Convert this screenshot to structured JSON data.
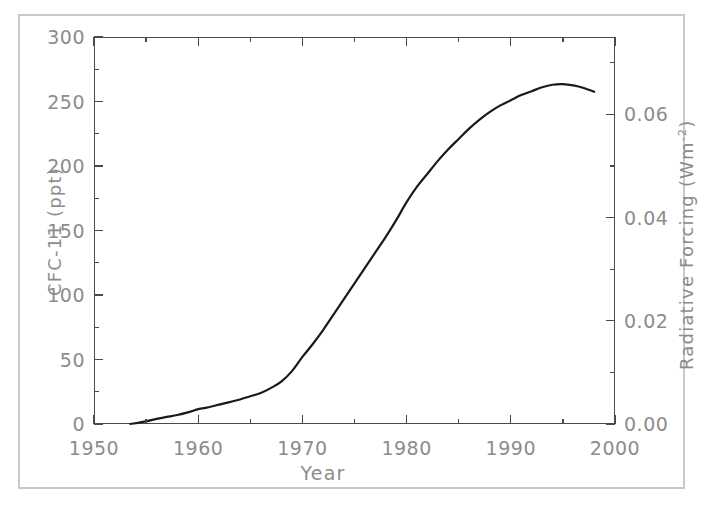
{
  "chart_data": {
    "type": "line",
    "title": "",
    "xlabel": "Year",
    "ylabel": "CFC-11 (ppt)",
    "y2label": "Radiative Forcing (Wm-2)",
    "y2label_base": "Radiative Forcing (Wm",
    "y2label_exponent": "-2",
    "y2label_close": ")",
    "xlim": [
      1950,
      2000
    ],
    "ylim": [
      0,
      300
    ],
    "y2lim": [
      0.0,
      0.075
    ],
    "grid": false,
    "legend": null,
    "xticks": [
      1950,
      1960,
      1970,
      1980,
      1990,
      2000
    ],
    "xticklabels": [
      "1950",
      "1960",
      "1970",
      "1980",
      "1990",
      "2000"
    ],
    "xminorticks": [
      1955,
      1965,
      1975,
      1985,
      1995
    ],
    "yticks": [
      0,
      50,
      100,
      150,
      200,
      250,
      300
    ],
    "yticklabels": [
      "0",
      "50",
      "100",
      "150",
      "200",
      "250",
      "300"
    ],
    "yminorticks": [
      25,
      75,
      125,
      175,
      225,
      275
    ],
    "y2ticks": [
      0.0,
      0.02,
      0.04,
      0.06
    ],
    "y2ticklabels": [
      "0.00",
      "0.02",
      "0.04",
      "0.06"
    ],
    "y2minorticks": [
      0.01,
      0.03,
      0.05,
      0.07
    ],
    "series": [
      {
        "name": "CFC-11",
        "color": "#1a1a1a",
        "linewidth": 2.2,
        "x": [
          1953.5,
          1955,
          1956,
          1957,
          1958,
          1959,
          1960,
          1961,
          1962,
          1963,
          1964,
          1965,
          1966,
          1967,
          1968,
          1969,
          1970,
          1971,
          1972,
          1973,
          1974,
          1975,
          1976,
          1977,
          1978,
          1979,
          1980,
          1981,
          1982,
          1983,
          1984,
          1985,
          1986,
          1987,
          1988,
          1989,
          1990,
          1991,
          1992,
          1993,
          1994,
          1995,
          1996,
          1997,
          1998
        ],
        "y": [
          0,
          2,
          4,
          5.5,
          7,
          9,
          11.5,
          13,
          15,
          17,
          19,
          21.5,
          24,
          28,
          33,
          41,
          52,
          62,
          73,
          85,
          97,
          109,
          121,
          133,
          145,
          158,
          172,
          184,
          194,
          204,
          213,
          221,
          229,
          236,
          242,
          247,
          251,
          255,
          258,
          261,
          263,
          263.5,
          262.5,
          260.5,
          257.5
        ]
      }
    ]
  },
  "axes": {
    "x_title": "Year",
    "y_left_title": "CFC-11 (ppt)",
    "y_right_title_base": "Radiative Forcing (Wm",
    "y_right_title_exp": "-2",
    "y_right_title_close": ")"
  }
}
